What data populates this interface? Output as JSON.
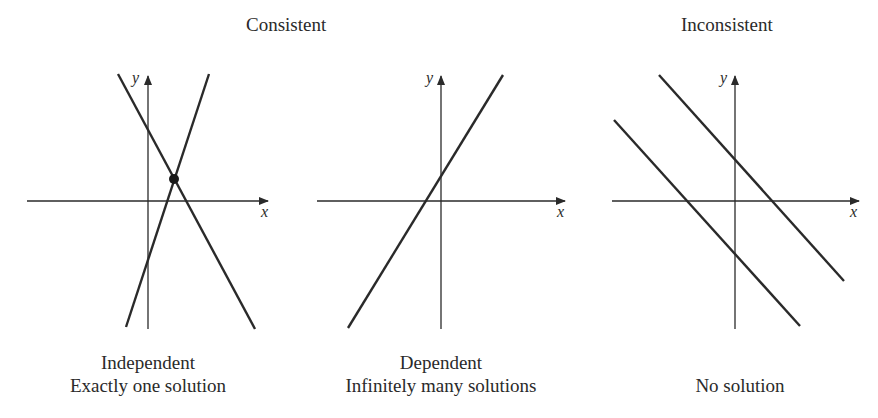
{
  "headers": {
    "consistent": "Consistent",
    "inconsistent": "Inconsistent"
  },
  "panels": [
    {
      "id": "independent",
      "x_label": "x",
      "y_label": "y",
      "caption_line1": "Independent",
      "caption_line2": "Exactly one solution",
      "lines": [
        {
          "x1": 118,
          "y1": 74,
          "x2": 255,
          "y2": 329
        },
        {
          "x1": 126,
          "y1": 327,
          "x2": 209,
          "y2": 74
        }
      ],
      "intersection_point": {
        "cx": 174,
        "cy": 179
      }
    },
    {
      "id": "dependent",
      "x_label": "x",
      "y_label": "y",
      "caption_line1": "Dependent",
      "caption_line2": "Infinitely many solutions",
      "lines": [
        {
          "x1": 348,
          "y1": 328,
          "x2": 503,
          "y2": 75
        }
      ]
    },
    {
      "id": "inconsistent",
      "x_label": "x",
      "y_label": "y",
      "caption_line1": "",
      "caption_line2": "No solution",
      "lines": [
        {
          "x1": 659,
          "y1": 75,
          "x2": 844,
          "y2": 281
        },
        {
          "x1": 614,
          "y1": 120,
          "x2": 800,
          "y2": 326
        }
      ]
    }
  ],
  "colors": {
    "ink": "#2a2a2a",
    "background": "#ffffff"
  }
}
